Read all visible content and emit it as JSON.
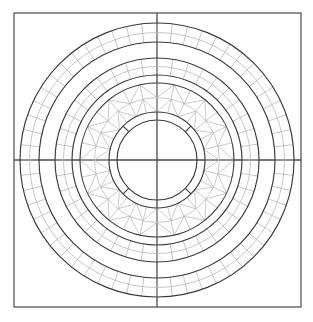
{
  "figure": {
    "name": "concentric-annular-mesh",
    "width": 313,
    "height": 322,
    "background_color": "#ffffff"
  },
  "colors": {
    "frame_line": "#4a4a4a",
    "boundary_line": "#3a3a3a",
    "mesh_line": "#b9b9b9",
    "triangle_line": "#bdbdbd",
    "background": "#ffffff"
  },
  "geometry": {
    "center_x": 157,
    "center_y": 160,
    "frame": {
      "left": 14,
      "top": 13,
      "right": 301,
      "bottom": 307,
      "stroke_width": 1.2
    },
    "crosshair": {
      "vertical_x": 157,
      "horizontal_y": 160,
      "stroke_width": 1.3
    }
  },
  "chart_data": {
    "type": "diagram",
    "title": "",
    "subtitle": "",
    "xlabel": "",
    "ylabel": "",
    "legend": [],
    "annotations": [],
    "grid": false,
    "rings": [
      {
        "name": "outer-quad-ring",
        "kind": "quad-mesh",
        "r_outer": 137,
        "r_inner": 118,
        "radial_divisions": 2,
        "circumferential_divisions": 56,
        "mesh_color": "#b9b9b9",
        "boundary_color": "#3a3a3a"
      },
      {
        "name": "outer-gap-ring",
        "kind": "empty",
        "r_outer": 118,
        "r_inner": 102,
        "radial_divisions": 0,
        "circumferential_divisions": 0,
        "mesh_color": "#ffffff",
        "boundary_color": "#3a3a3a"
      },
      {
        "name": "middle-quad-ring",
        "kind": "quad-mesh",
        "r_outer": 102,
        "r_inner": 85,
        "radial_divisions": 2,
        "circumferential_divisions": 40,
        "mesh_color": "#b9b9b9",
        "boundary_color": "#3a3a3a"
      },
      {
        "name": "middle-gap-ring",
        "kind": "empty",
        "r_outer": 85,
        "r_inner": 77,
        "radial_divisions": 0,
        "circumferential_divisions": 0,
        "mesh_color": "#ffffff",
        "boundary_color": "#3a3a3a"
      },
      {
        "name": "triangular-ring",
        "kind": "triangle-mesh",
        "r_outer": 77,
        "r_inner": 48,
        "radial_divisions": 2,
        "circumferential_divisions": 28,
        "mesh_color": "#bdbdbd",
        "boundary_color": "#3a3a3a"
      },
      {
        "name": "inner-segmented-ring",
        "kind": "segmented",
        "r_outer": 48,
        "r_inner": 40,
        "radial_divisions": 1,
        "circumferential_divisions": 4,
        "segment_angles_deg": [
          45,
          135,
          225,
          315
        ],
        "mesh_color": "#3a3a3a",
        "boundary_color": "#3a3a3a"
      },
      {
        "name": "inner-core-disc",
        "kind": "empty",
        "r_outer": 40,
        "r_inner": 0,
        "radial_divisions": 0,
        "circumferential_divisions": 0,
        "mesh_color": "#ffffff",
        "boundary_color": "#3a3a3a"
      }
    ],
    "radial_spokes": {
      "description": "Short radial tick marks on outer quad ring at cardinal directions",
      "angles_deg": [
        0,
        90,
        180,
        270
      ]
    }
  }
}
